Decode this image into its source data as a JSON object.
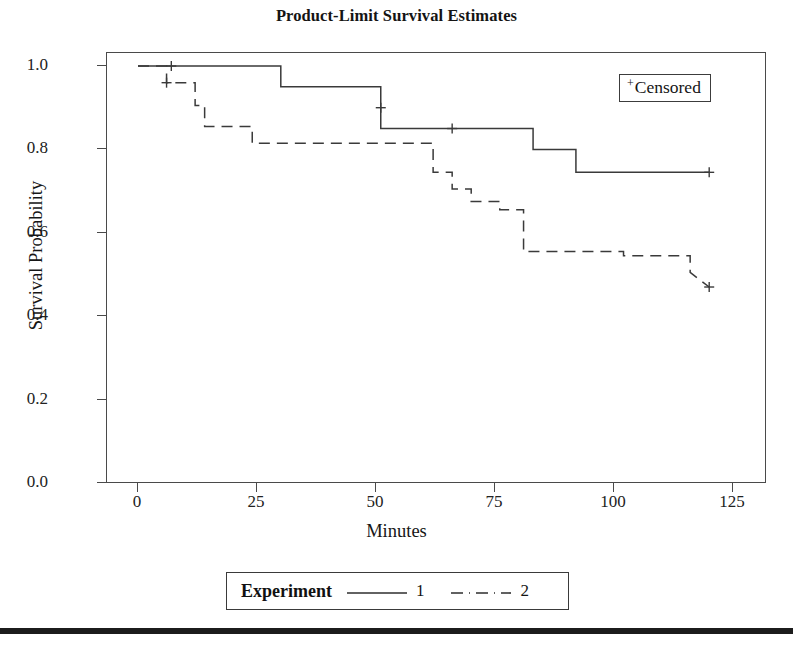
{
  "chart_data": {
    "type": "line",
    "title": "Product-Limit Survival Estimates",
    "xlabel": "Minutes",
    "ylabel": "Survival Probability",
    "xlim": [
      0,
      125
    ],
    "ylim": [
      0.0,
      1.0
    ],
    "xticks": [
      0,
      25,
      50,
      75,
      100,
      125
    ],
    "yticks": [
      "0.0",
      "0.2",
      "0.4",
      "0.6",
      "0.8",
      "1.0"
    ],
    "grid": false,
    "legend_position": "bottom-center",
    "legend_title": "Experiment",
    "censored_legend": "Censored",
    "censored_symbol": "+",
    "series": [
      {
        "name": "1",
        "label": "1",
        "linestyle": "solid",
        "color": "#3a3a3a",
        "steps_x": [
          0,
          30,
          30,
          51,
          51,
          83,
          83,
          92,
          92,
          120
        ],
        "steps_y": [
          1.0,
          1.0,
          0.95,
          0.95,
          0.85,
          0.85,
          0.8,
          0.8,
          0.745,
          0.745
        ],
        "censored_points": [
          {
            "x": 7,
            "y": 1.0
          },
          {
            "x": 51,
            "y": 0.9
          },
          {
            "x": 66,
            "y": 0.85
          },
          {
            "x": 120,
            "y": 0.745
          }
        ]
      },
      {
        "name": "2",
        "label": "2",
        "linestyle": "dashed",
        "color": "#3a3a3a",
        "steps_x": [
          0,
          6,
          6,
          12,
          12,
          14,
          14,
          24,
          24,
          62,
          62,
          66,
          66,
          70,
          70,
          76,
          76,
          81,
          81,
          102,
          102,
          116,
          116,
          120
        ],
        "steps_y": [
          1.0,
          1.0,
          0.96,
          0.96,
          0.905,
          0.905,
          0.855,
          0.855,
          0.815,
          0.815,
          0.745,
          0.745,
          0.705,
          0.705,
          0.675,
          0.675,
          0.655,
          0.655,
          0.555,
          0.555,
          0.545,
          0.545,
          0.505,
          0.47
        ],
        "censored_points": [
          {
            "x": 6,
            "y": 0.96
          },
          {
            "x": 120,
            "y": 0.47
          }
        ]
      }
    ]
  },
  "figure": {
    "title": "Product-Limit Survival Estimates",
    "x_axis_title": "Minutes",
    "y_axis_title": "Survival Probability",
    "x_tick_labels": [
      "0",
      "25",
      "50",
      "75",
      "100",
      "125"
    ],
    "y_tick_labels": [
      "1.0",
      "0.8",
      "0.6",
      "0.4",
      "0.2",
      "0.0"
    ],
    "censored_box": {
      "symbol": "+",
      "label": "Censored"
    },
    "experiment_legend": {
      "title": "Experiment",
      "entry_1_label": "1",
      "entry_2_label": "2"
    },
    "colors": {
      "line": "#3a3a3a",
      "axis": "#4a4a4a",
      "text": "#141414",
      "rule": "#1c1c1c"
    }
  }
}
